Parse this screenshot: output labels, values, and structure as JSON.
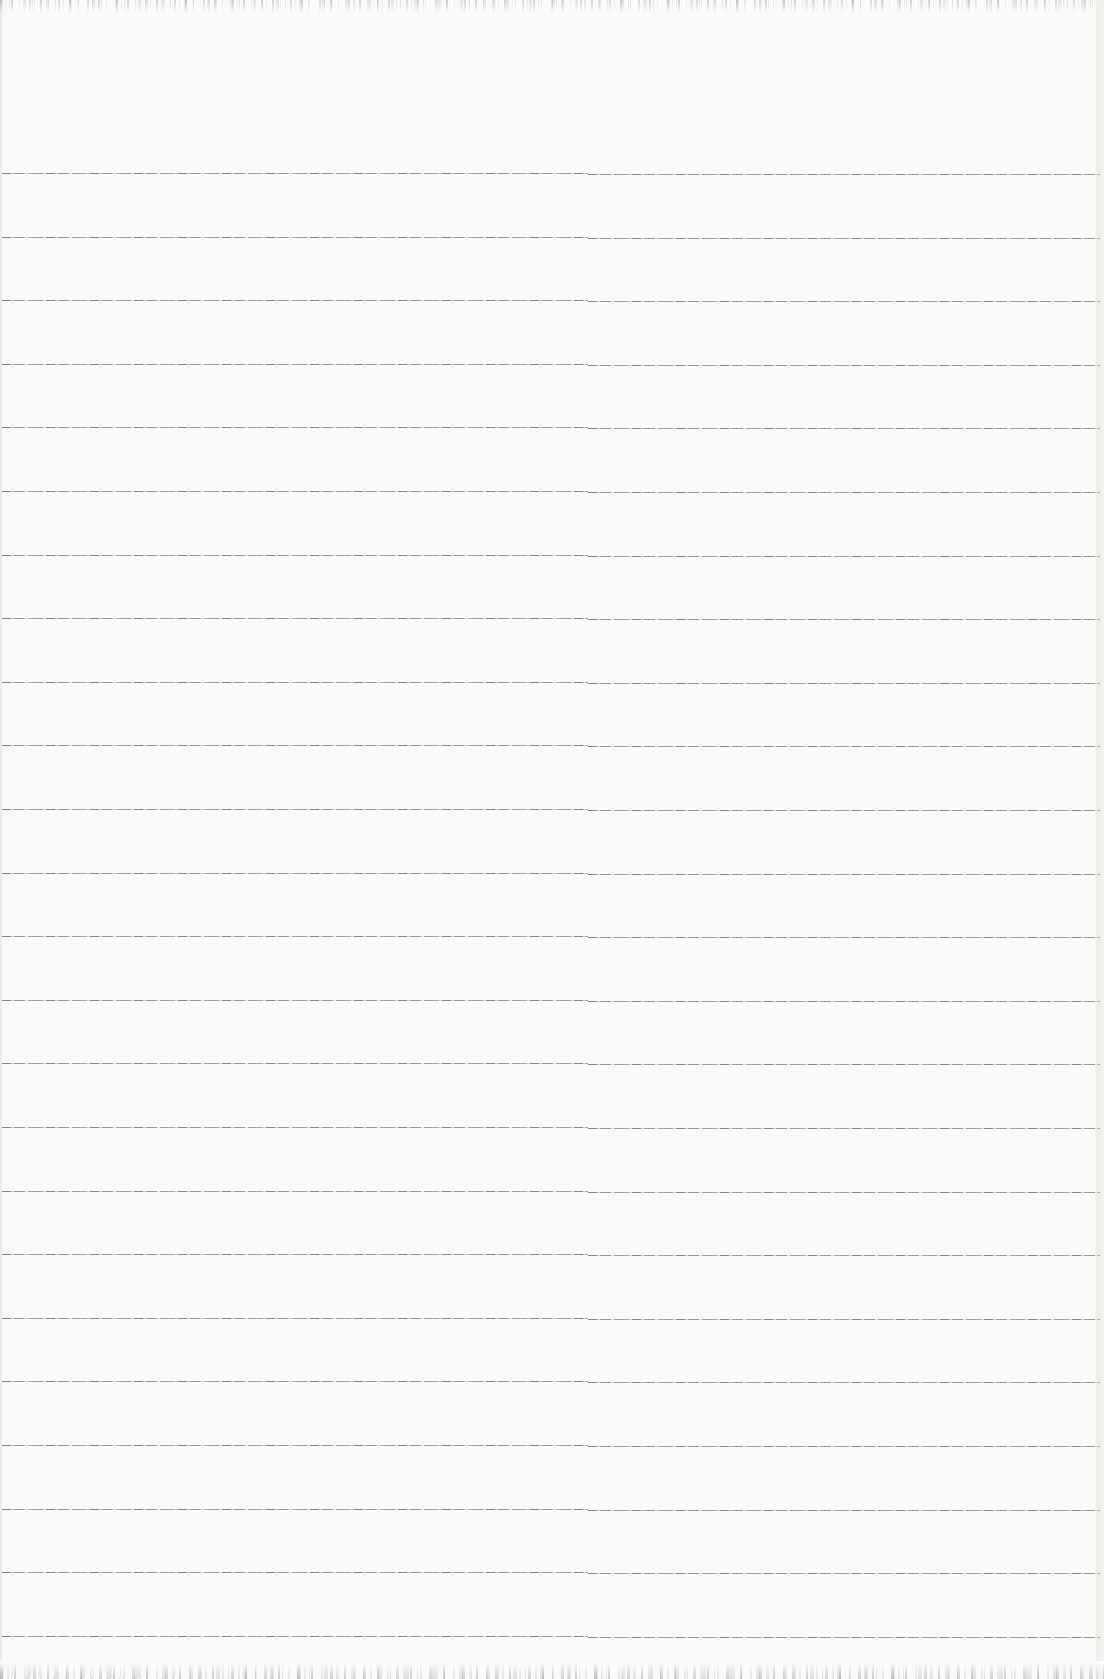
{
  "document": {
    "kind": "scanned-blank-ruled-notebook-page",
    "visible_text": "",
    "paper_color": "#fafaf9",
    "rule_color": "#646464",
    "ruling": {
      "line_count": 24,
      "first_line_y": 174,
      "line_spacing_px": 63.6,
      "line_start_x": 2,
      "line_end_x": 1100,
      "seam_x": 588,
      "seam_step_px": 1
    },
    "edges": {
      "top_grain_height_px": 14,
      "bottom_grain_height_px": 18,
      "left_edge_shadow": true,
      "right_edge_shadow": true
    }
  }
}
